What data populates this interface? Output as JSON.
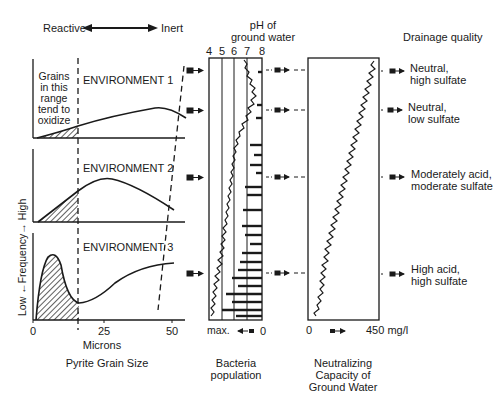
{
  "header": {
    "reactive_label": "Reactive",
    "inert_label": "Inert",
    "ph_title_line1": "pH of",
    "ph_title_line2": "ground water",
    "drainage_title": "Drainage quality"
  },
  "grain_panel": {
    "annotation": [
      "Grains",
      "in this",
      "range",
      "tend to",
      "oxidize"
    ],
    "environments": [
      "ENVIRONMENT 1",
      "ENVIRONMENT 2",
      "ENVIRONMENT 3"
    ],
    "y_axis_label": "Low ←Frequency→ High",
    "x_ticks": [
      "0",
      "25",
      "50"
    ],
    "x_label": "Microns",
    "caption": "Pyrite Grain Size"
  },
  "ph_panel": {
    "ticks": [
      "4",
      "5",
      "6",
      "7",
      "8"
    ],
    "bottom_left": "max.",
    "bottom_right": "0",
    "caption_line1": "Bacteria",
    "caption_line2": "population"
  },
  "neutral_panel": {
    "bottom_left": "0",
    "bottom_right": "450 mg/l",
    "caption_line1": "Neutralizing",
    "caption_line2": "Capacity of",
    "caption_line3": "Ground Water"
  },
  "drainage": [
    {
      "line1": "Neutral,",
      "line2": "high sulfate"
    },
    {
      "line1": "Neutral,",
      "line2": "low sulfate"
    },
    {
      "line1": "Moderately acid,",
      "line2": "moderate sulfate"
    },
    {
      "line1": "High acid,",
      "line2": "high sulfate"
    }
  ]
}
